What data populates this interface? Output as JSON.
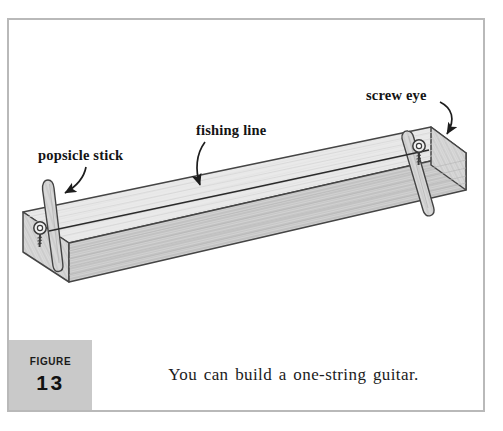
{
  "figure": {
    "label_word": "Figure",
    "number": "13",
    "caption": "You can build a one-string guitar."
  },
  "illustration": {
    "title": "one-string guitar built from a board, popsicle sticks, screw eyes and fishing line",
    "annotations": [
      {
        "id": "popsicle-stick",
        "text": "popsicle stick"
      },
      {
        "id": "fishing-line",
        "text": "fishing line"
      },
      {
        "id": "screw-eye",
        "text": "screw eye"
      }
    ],
    "parts": [
      {
        "id": "board",
        "name": "wooden board"
      },
      {
        "id": "popsicle-stick-left",
        "name": "popsicle stick left"
      },
      {
        "id": "popsicle-stick-right",
        "name": "popsicle stick right"
      },
      {
        "id": "screw-eye-left",
        "name": "screw eye left"
      },
      {
        "id": "screw-eye-right",
        "name": "screw eye right"
      },
      {
        "id": "string",
        "name": "fishing line string"
      }
    ]
  },
  "colors": {
    "frame": "#b9b9b9",
    "badge_bg": "#c9c9c9",
    "board_top": "#e9e9e9",
    "board_front": "#cfcfcf",
    "board_end": "#dcdcdc",
    "outline": "#3a3a3a",
    "text": "#141414",
    "page_bg": "#ffffff"
  }
}
